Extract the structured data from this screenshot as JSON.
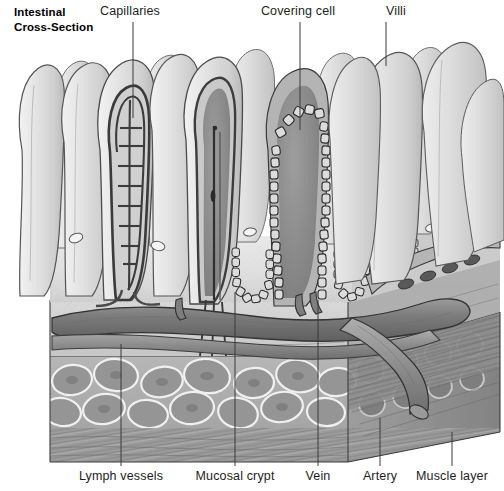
{
  "figure": {
    "title_lines": [
      "Intestinal",
      "Cross-Section"
    ],
    "kind": "anatomical-illustration",
    "background_color": "#ffffff",
    "ink_color": "#3a3a3a",
    "tissue_light": "#e6e6e6",
    "tissue_mid": "#b8b8b8",
    "tissue_dark": "#8a8a8a",
    "vessel_color": "#7e7e7e"
  },
  "labels": {
    "top": [
      {
        "text": "Capillaries",
        "text_x": 130,
        "text_y": 15,
        "anchor": "middle",
        "leader_x": 133,
        "leader_y1": 22,
        "leader_y2": 118
      },
      {
        "text": "Covering cell",
        "text_x": 298,
        "text_y": 15,
        "anchor": "middle",
        "leader_x": 300,
        "leader_y1": 22,
        "leader_y2": 130
      },
      {
        "text": "Villi",
        "text_x": 396,
        "text_y": 15,
        "anchor": "middle",
        "leader_x": 386,
        "leader_y1": 22,
        "leader_y2": 66
      }
    ],
    "bottom": [
      {
        "text": "Lymph vessels",
        "text_x": 121,
        "text_y": 480,
        "anchor": "middle",
        "leader_x": 121,
        "leader_y1": 344,
        "leader_y2": 466
      },
      {
        "text": "Mucosal crypt",
        "text_x": 235,
        "text_y": 480,
        "anchor": "middle",
        "leader_x": 235,
        "leader_y1": 318,
        "leader_y2": 466
      },
      {
        "text": "Vein",
        "text_x": 318,
        "text_y": 480,
        "anchor": "middle",
        "leader_x": 318,
        "leader_y1": 340,
        "leader_y2": 466
      },
      {
        "text": "Artery",
        "text_x": 380,
        "text_y": 480,
        "anchor": "middle",
        "leader_x": 380,
        "leader_y1": 418,
        "leader_y2": 466
      },
      {
        "text": "Muscle layer",
        "text_x": 452,
        "text_y": 480,
        "anchor": "middle",
        "leader_x": 452,
        "leader_y1": 432,
        "leader_y2": 466
      }
    ]
  },
  "structures": {
    "villi_count": 14,
    "crypt_count": 6,
    "muscle_cell_rows": 2,
    "named_parts": [
      "villi",
      "capillary network",
      "central lacteal",
      "covering cell epithelium",
      "mucosal crypt",
      "submucosal vein",
      "submucosal artery",
      "muscle layer",
      "lymph vessels"
    ]
  }
}
